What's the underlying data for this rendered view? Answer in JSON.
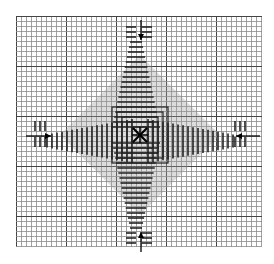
{
  "diagram": {
    "type": "needlework-chart",
    "grid": {
      "left": 16,
      "top": 16,
      "right": 262,
      "bottom": 247,
      "cell": 5,
      "bold_every": 10,
      "line_color": "#8a8a8a",
      "bold_color": "#444444"
    },
    "center": {
      "x": 140,
      "y": 135,
      "marker": "x-cross"
    },
    "arrows": [
      {
        "name": "top-arrow",
        "direction": "down",
        "x": 141,
        "y1": 20,
        "y2": 40
      },
      {
        "name": "bottom-arrow",
        "direction": "up",
        "x": 141,
        "y1": 252,
        "y2": 232
      },
      {
        "name": "left-arrow",
        "direction": "right",
        "y": 136,
        "x1": 26,
        "x2": 51
      },
      {
        "name": "right-arrow",
        "direction": "left",
        "y": 136,
        "x1": 260,
        "x2": 236
      }
    ],
    "motif": {
      "petals": 8,
      "stitch_color": "#222222",
      "fill_color": "#9a9a9a"
    }
  }
}
